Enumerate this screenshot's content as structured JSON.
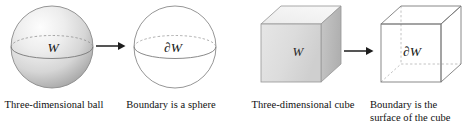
{
  "figure": {
    "background": "#ffffff",
    "stroke_color": "#6e6e6e",
    "label_color": "#151515"
  },
  "panels": [
    {
      "id": "ball",
      "source": {
        "shape": "solid-sphere",
        "label": "W",
        "caption": "Three-dimensional ball",
        "fill_light": "#fbfbfb",
        "fill_mid": "#d8d8d8",
        "fill_dark": "#b5b5b5"
      },
      "arrow": {
        "glyph": "right-arrow"
      },
      "target": {
        "shape": "wireframe-sphere",
        "label": "∂W",
        "caption": "Boundary is a sphere"
      }
    },
    {
      "id": "cube",
      "source": {
        "shape": "solid-cube",
        "label": "W",
        "caption": "Three-dimensional cube",
        "fill_top": "#f2f2f2",
        "fill_front": "#dcdcdc",
        "fill_side": "#bcbcbc"
      },
      "arrow": {
        "glyph": "right-arrow"
      },
      "target": {
        "shape": "wireframe-cube",
        "label": "∂W",
        "caption_line1": "Boundary is the",
        "caption_line2": "surface of the cube"
      }
    }
  ]
}
